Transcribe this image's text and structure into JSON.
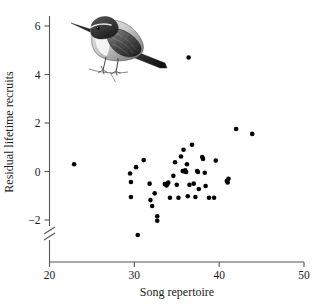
{
  "figure": {
    "background_color": "#ffffff",
    "mark_color": "#000000",
    "axis_color": "#555555",
    "marker_radius_px": 2.3,
    "illustration": {
      "name": "bird-illustration",
      "subject": "songbird perched on twig",
      "style": "pen-and-ink stipple engraving",
      "x_px": 62,
      "y_px": 6,
      "width_px": 108,
      "height_px": 78
    }
  },
  "chart_data": {
    "type": "scatter",
    "title": "",
    "xlabel": "Song repertoire",
    "ylabel": "Residual lifetime recruits",
    "xlim": [
      20,
      50
    ],
    "ylim": [
      -3.0,
      6.4
    ],
    "xticks": [
      20,
      30,
      40,
      50
    ],
    "xticklabels": [
      "20",
      "30",
      "40",
      "50"
    ],
    "yticks": [
      -2,
      0,
      2,
      4,
      6
    ],
    "yticklabels": [
      "−2",
      "0",
      "2",
      "4",
      "6"
    ],
    "grid": false,
    "legend": null,
    "axis_break": {
      "axis": "y",
      "present": true,
      "below_value": -2,
      "symbol": "double-slash"
    },
    "spines": [
      "left",
      "bottom"
    ],
    "points": [
      [
        22.9,
        0.3
      ],
      [
        29.5,
        -0.08
      ],
      [
        29.6,
        -0.43
      ],
      [
        29.6,
        -1.05
      ],
      [
        30.2,
        0.18
      ],
      [
        30.4,
        -2.62
      ],
      [
        31.1,
        0.47
      ],
      [
        31.8,
        -0.5
      ],
      [
        31.9,
        -1.18
      ],
      [
        32.1,
        -1.42
      ],
      [
        32.4,
        -0.9
      ],
      [
        32.7,
        -1.85
      ],
      [
        32.7,
        -2.03
      ],
      [
        33.6,
        -0.52
      ],
      [
        33.8,
        -0.58
      ],
      [
        33.9,
        -0.5
      ],
      [
        34.0,
        -0.46
      ],
      [
        34.2,
        -1.08
      ],
      [
        34.6,
        -0.18
      ],
      [
        34.8,
        0.38
      ],
      [
        35.0,
        -0.55
      ],
      [
        35.2,
        -1.08
      ],
      [
        35.5,
        0.62
      ],
      [
        35.7,
        0.02
      ],
      [
        35.8,
        0.9
      ],
      [
        35.9,
        0.0
      ],
      [
        36.0,
        0.05
      ],
      [
        36.1,
        -0.02
      ],
      [
        36.2,
        0.3
      ],
      [
        36.3,
        -1.02
      ],
      [
        36.4,
        4.7
      ],
      [
        36.5,
        -0.55
      ],
      [
        36.8,
        1.1
      ],
      [
        37.0,
        -0.5
      ],
      [
        37.2,
        -1.05
      ],
      [
        37.4,
        0.02
      ],
      [
        37.5,
        -0.02
      ],
      [
        37.6,
        -0.72
      ],
      [
        38.0,
        0.6
      ],
      [
        38.1,
        0.52
      ],
      [
        38.3,
        -0.05
      ],
      [
        38.4,
        -0.6
      ],
      [
        38.8,
        -1.08
      ],
      [
        39.4,
        -1.08
      ],
      [
        39.6,
        0.45
      ],
      [
        40.9,
        -0.38
      ],
      [
        41.0,
        -0.45
      ],
      [
        41.1,
        -0.3
      ],
      [
        42.0,
        1.75
      ],
      [
        43.9,
        1.55
      ]
    ]
  }
}
